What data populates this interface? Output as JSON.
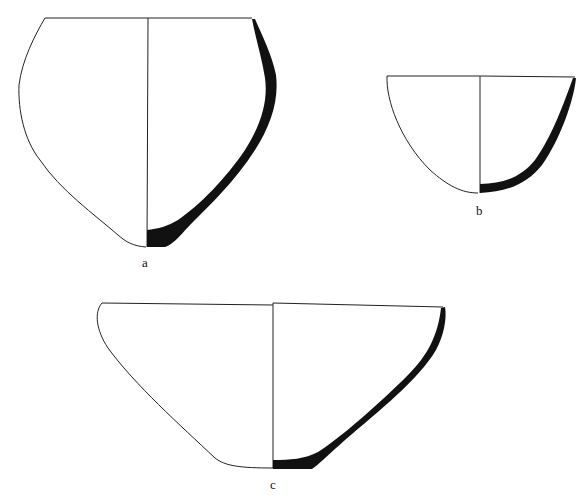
{
  "figure": {
    "vessels": [
      {
        "id": "a",
        "label": "a",
        "description": "Vessel profile a: restricted-mouth jar/bowl, half exterior outline, half section"
      },
      {
        "id": "b",
        "label": "b",
        "description": "Vessel profile b: small rounded bowl"
      },
      {
        "id": "c",
        "label": "c",
        "description": "Vessel profile c: wide flaring bowl with flat base"
      }
    ],
    "colors": {
      "line": "#222222",
      "section": "#111111",
      "background": "#ffffff"
    }
  }
}
